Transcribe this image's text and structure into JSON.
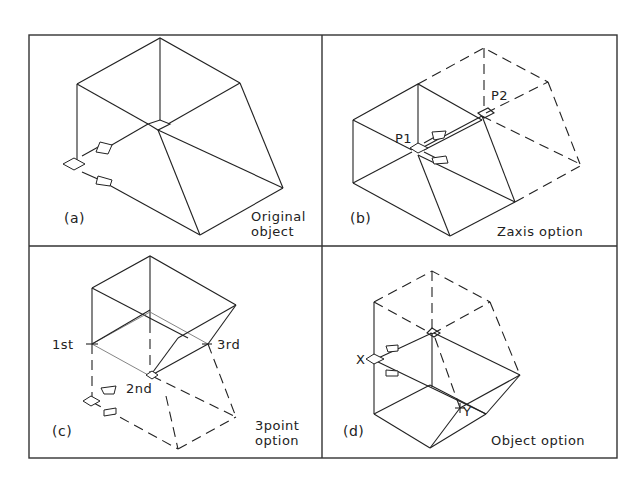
{
  "figure": {
    "panels": [
      {
        "id": "a",
        "label": "(a)",
        "caption_lines": [
          "Original",
          "object"
        ]
      },
      {
        "id": "b",
        "label": "(b)",
        "caption_lines": [
          "Zaxis option"
        ],
        "points": [
          "P1",
          "P2"
        ]
      },
      {
        "id": "c",
        "label": "(c)",
        "caption_lines": [
          "3point",
          "option"
        ],
        "points": [
          "1st",
          "2nd",
          "3rd"
        ]
      },
      {
        "id": "d",
        "label": "(d)",
        "caption_lines": [
          "Object option"
        ],
        "points": [
          "X",
          "Y"
        ]
      }
    ]
  },
  "colors": {
    "line": "#222222",
    "background": "#ffffff"
  }
}
